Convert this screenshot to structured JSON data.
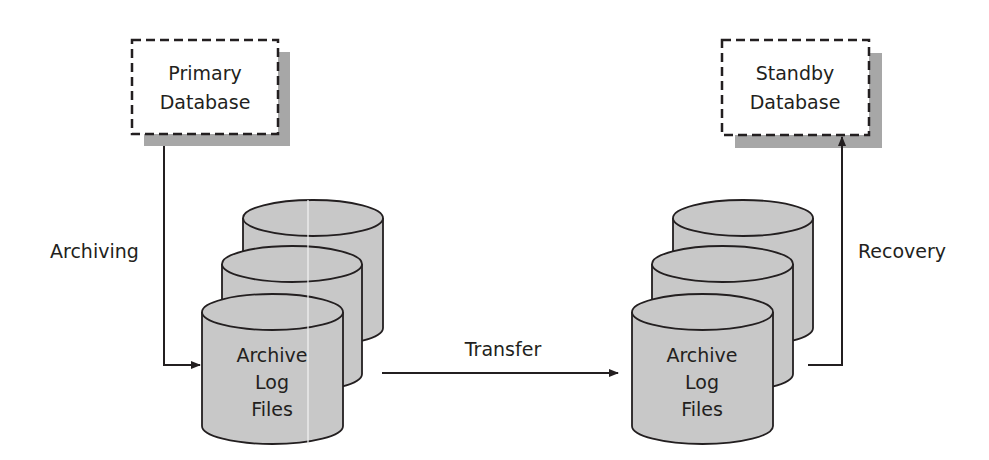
{
  "diagram": {
    "nodes": {
      "primary_db": {
        "line1": "Primary",
        "line2": "Database"
      },
      "standby_db": {
        "line1": "Standby",
        "line2": "Database"
      },
      "archive_left": {
        "line1": "Archive",
        "line2": "Log",
        "line3": "Files"
      },
      "archive_right": {
        "line1": "Archive",
        "line2": "Log",
        "line3": "Files"
      }
    },
    "edges": {
      "archiving": "Archiving",
      "transfer": "Transfer",
      "recovery": "Recovery"
    },
    "colors": {
      "cylinder_fill": "#c8c8c8",
      "shadow": "#a7a7a7",
      "stroke": "#231f20",
      "box_fill": "#ffffff"
    }
  }
}
